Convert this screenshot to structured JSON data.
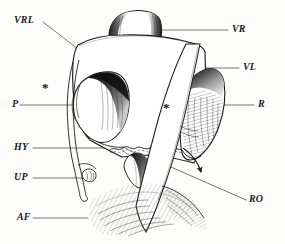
{
  "figure": {
    "type": "anatomical-line-drawing",
    "background_color": "#fdfdfc",
    "ink_color": "#1b1b1b",
    "labels": [
      {
        "key": "vrl",
        "text": "VRL",
        "x": 14,
        "y": 15,
        "leader_from": [
          43,
          22
        ],
        "leader_to": [
          113,
          76
        ],
        "side": "left"
      },
      {
        "key": "vr",
        "text": "VR",
        "x": 232,
        "y": 24,
        "leader_from": [
          228,
          30
        ],
        "leader_to": [
          146,
          30
        ],
        "side": "right"
      },
      {
        "key": "vl",
        "text": "VL",
        "x": 243,
        "y": 62,
        "leader_from": [
          239,
          68
        ],
        "leader_to": [
          152,
          68
        ],
        "side": "right"
      },
      {
        "key": "p",
        "text": "P",
        "x": 12,
        "y": 99,
        "leader_from": [
          20,
          105
        ],
        "leader_to": [
          78,
          105
        ],
        "side": "left"
      },
      {
        "key": "r",
        "text": "R",
        "x": 258,
        "y": 99,
        "leader_from": [
          254,
          105
        ],
        "leader_to": [
          202,
          105
        ],
        "side": "right"
      },
      {
        "key": "hy",
        "text": "HY",
        "x": 14,
        "y": 142,
        "leader_from": [
          33,
          148
        ],
        "leader_to": [
          112,
          148
        ],
        "side": "left"
      },
      {
        "key": "up",
        "text": "UP",
        "x": 14,
        "y": 172,
        "leader_from": [
          33,
          178
        ],
        "leader_to": [
          95,
          178
        ],
        "side": "left"
      },
      {
        "key": "ro",
        "text": "RO",
        "x": 249,
        "y": 194,
        "leader_from": [
          246,
          200
        ],
        "leader_to": [
          155,
          160
        ],
        "side": "right"
      },
      {
        "key": "af",
        "text": "AF",
        "x": 17,
        "y": 212,
        "leader_from": [
          33,
          218
        ],
        "leader_to": [
          88,
          218
        ],
        "side": "left"
      }
    ],
    "asterisks": [
      {
        "key": "asterisk-left",
        "text": "*",
        "x": 42,
        "y": 81
      },
      {
        "key": "asterisk-right",
        "text": "*",
        "x": 163,
        "y": 101
      }
    ],
    "annotations": {
      "arrow_count": 1,
      "arrow_description": "curved arrow indicating rotation at lower right"
    }
  }
}
